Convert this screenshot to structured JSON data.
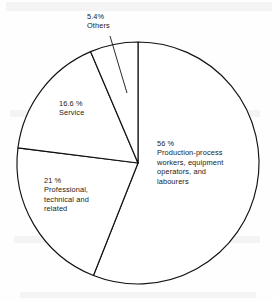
{
  "chart_data": {
    "type": "pie",
    "title": "",
    "xlabel": "",
    "ylabel": "",
    "legend_position": "none",
    "grid": false,
    "start_angle_deg": 0,
    "direction": "clockwise",
    "categories": [
      "Production-process workers, equipment operators, and labourers",
      "Professional, technical and related",
      "Service",
      "Others"
    ],
    "values": [
      56,
      21,
      16.6,
      5.4
    ],
    "value_unit": "%",
    "slices": [
      {
        "name": "production",
        "value": 56,
        "percent_label": "56 %",
        "label_lines": [
          "56 %",
          "Production-process",
          "workers, equipment",
          "operators, and",
          "labourers"
        ],
        "start_deg": 0,
        "end_deg": 201.6,
        "color": "#ffffff"
      },
      {
        "name": "professional",
        "value": 21,
        "percent_label": "21 %",
        "label_lines": [
          "21 %",
          "Professional,",
          "technical and",
          "related"
        ],
        "start_deg": 201.6,
        "end_deg": 277.2,
        "color": "#ffffff"
      },
      {
        "name": "service",
        "value": 16.6,
        "percent_label": "16.6 %",
        "label_lines": [
          "16.6 %",
          "Service"
        ],
        "start_deg": 277.2,
        "end_deg": 336.96,
        "color": "#ffffff"
      },
      {
        "name": "others",
        "value": 5.4,
        "percent_label": "5.4%",
        "label_lines": [
          "5.4%",
          "Others"
        ],
        "start_deg": 336.96,
        "end_deg": 360,
        "color": "#ffffff"
      }
    ]
  },
  "labels": {
    "others": "5.4%\nOthers",
    "service": "16.6 %\nService",
    "production": "56 %\nProduction-process\nworkers, equipment\noperators, and\nlabourers",
    "professional": "21 %\nProfessional,\ntechnical and\nrelated"
  },
  "geometry": {
    "center_x": 138,
    "center_y": 163,
    "radius": 121,
    "stroke_color": "#111111",
    "fill_color": "#ffffff"
  }
}
